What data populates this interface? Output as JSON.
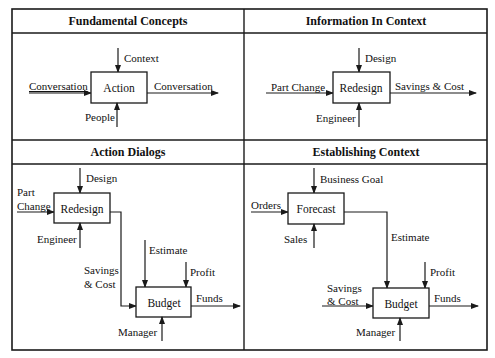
{
  "panels": [
    {
      "title": "Fundamental Concepts",
      "box": "Action",
      "inputs": [
        "Conversation"
      ],
      "controls": [
        "Context"
      ],
      "mechanisms": [
        "People"
      ],
      "outputs": [
        "Conversation"
      ]
    },
    {
      "title": "Information In Context",
      "box": "Redesign",
      "inputs": [
        "Part Change"
      ],
      "controls": [
        "Design"
      ],
      "mechanisms": [
        "Engineer"
      ],
      "outputs": [
        "Savings & Cost"
      ]
    },
    {
      "title": "Action Dialogs",
      "boxes": [
        {
          "label": "Redesign",
          "inputs": [
            "Part",
            "Change"
          ],
          "controls": [
            "Design"
          ],
          "mechanisms": [
            "Engineer"
          ]
        },
        {
          "label": "Budget",
          "inputs": [
            "Savings",
            "& Cost"
          ],
          "controls": [
            "Estimate",
            "Profit"
          ],
          "mechanisms": [
            "Manager"
          ],
          "outputs": [
            "Funds"
          ]
        }
      ]
    },
    {
      "title": "Establishing Context",
      "boxes": [
        {
          "label": "Forecast",
          "inputs": [
            "Orders"
          ],
          "controls": [
            "Business Goal"
          ],
          "mechanisms": [
            "Sales"
          ],
          "outputs": [
            "Estimate"
          ]
        },
        {
          "label": "Budget",
          "inputs": [
            "Savings",
            "& Cost"
          ],
          "controls": [
            "Profit"
          ],
          "mechanisms": [
            "Manager"
          ],
          "outputs": [
            "Funds"
          ]
        }
      ]
    }
  ],
  "colors": {
    "line": "#1a1a1a",
    "background": "#ffffff"
  }
}
